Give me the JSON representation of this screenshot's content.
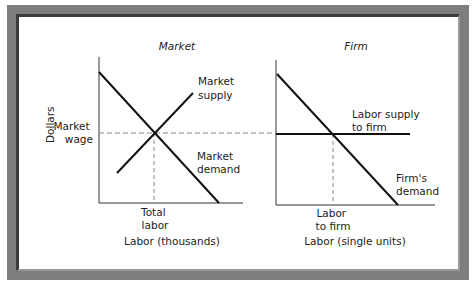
{
  "panels": {
    "market": {
      "title": "Market",
      "supply_label": [
        "Market",
        "supply"
      ],
      "demand_label": [
        "Market",
        "demand"
      ],
      "x_tick_label": [
        "Total",
        "labor"
      ],
      "x_axis_label": "Labor (thousands)"
    },
    "firm": {
      "title": "Firm",
      "supply_label": [
        "Labor supply",
        "to firm"
      ],
      "demand_label": [
        "Firm's",
        "demand"
      ],
      "x_tick_label": [
        "Labor",
        "to firm"
      ],
      "x_axis_label": "Labor (single units)"
    }
  },
  "y_axis_label": "Dollars",
  "wage_label": [
    "Market",
    "wage"
  ],
  "colors": {
    "frame": "#7d7d7d",
    "frame_dark": "#3a3a3a",
    "line": "#111111",
    "guide": "#888888"
  }
}
